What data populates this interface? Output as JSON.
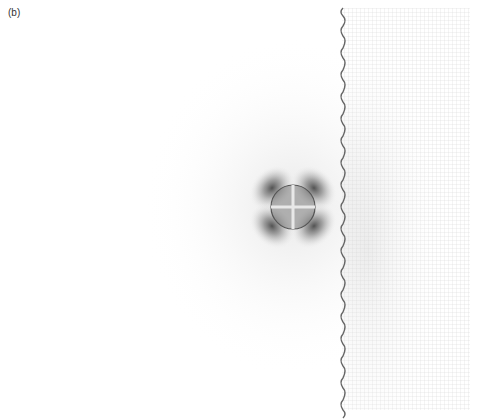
{
  "figure": {
    "panel_label": "(b)",
    "colors": {
      "background": "#ffffff",
      "lobe": "#555555",
      "inclusion_outline": "#5a5a5a",
      "interface": "#666666",
      "mesh": "#cfcfcf"
    },
    "inclusion": {
      "cx": 293,
      "cy": 207,
      "r": 22
    },
    "interface": {
      "x": 342,
      "y_top": 8,
      "y_bottom": 410
    },
    "mesh_region": {
      "x0": 342,
      "x1": 470,
      "y0": 8,
      "y1": 410,
      "cell": 4
    }
  }
}
